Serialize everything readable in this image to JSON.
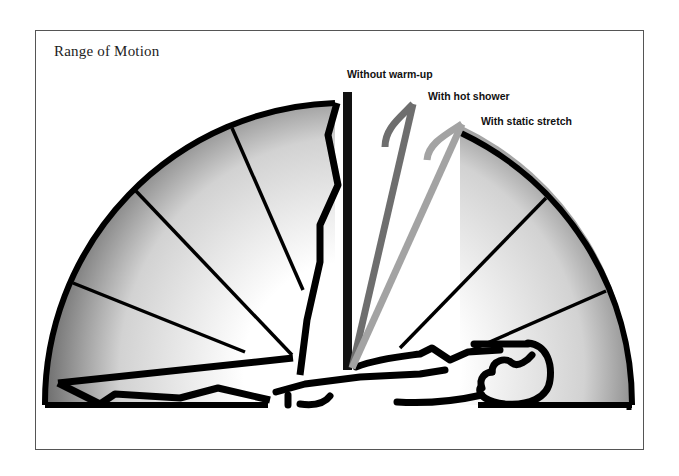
{
  "figure": {
    "title": "Range of Motion",
    "labels": {
      "without_warmup": "Without warm-up",
      "hot_shower": "With hot shower",
      "static_stretch": "With static stretch"
    },
    "legs": [
      {
        "id": "without-warmup",
        "label": "Without warm-up",
        "color": "#111111"
      },
      {
        "id": "hot-shower",
        "label": "With hot shower",
        "color": "#6e6e6e"
      },
      {
        "id": "static-stretch",
        "label": "With static stretch",
        "color": "#a3a3a3"
      }
    ],
    "colors": {
      "outline": "#000000",
      "fan_dark": "#6a6a6a",
      "fan_light": "#ffffff",
      "frame_border": "#555555"
    }
  }
}
